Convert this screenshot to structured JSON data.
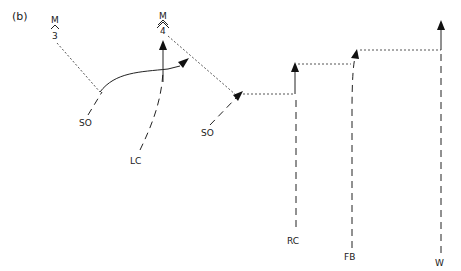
{
  "panel_label": "(b)",
  "nodes": {
    "m3": {
      "top": "M",
      "bottom": "3"
    },
    "m4": {
      "top": "M",
      "bottom": "4"
    },
    "so1": "SO",
    "so2": "SO",
    "lc": "LC",
    "rc": "RC",
    "fb": "FB",
    "w": "W"
  },
  "colors": {
    "ink": "#222222",
    "dotted": "#555555",
    "background": "#ffffff"
  }
}
